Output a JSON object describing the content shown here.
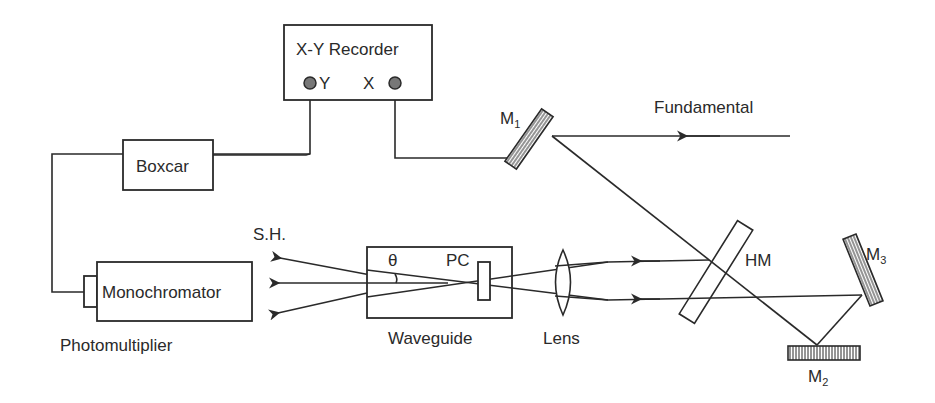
{
  "diagram": {
    "components": {
      "recorder": {
        "label": "X-Y Recorder",
        "port_y": "Y",
        "port_x": "X"
      },
      "boxcar": {
        "label": "Boxcar"
      },
      "monochromator": {
        "label": "Monochromator"
      },
      "photomultiplier": {
        "label": "Photomultiplier"
      },
      "waveguide": {
        "label": "Waveguide",
        "angle_symbol": "θ",
        "pc_label": "PC"
      },
      "lens": {
        "label": "Lens"
      },
      "half_mirror": {
        "label": "HM"
      },
      "mirror1": {
        "label": "M",
        "sub": "1"
      },
      "mirror2": {
        "label": "M",
        "sub": "2"
      },
      "mirror3": {
        "label": "M",
        "sub": "3"
      }
    },
    "beams": {
      "fundamental": {
        "label": "Fundamental"
      },
      "second_harmonic": {
        "label": "S.H."
      }
    },
    "colors": {
      "ink": "#2a2a2a",
      "background": "#ffffff",
      "port_fill": "#777777"
    }
  }
}
